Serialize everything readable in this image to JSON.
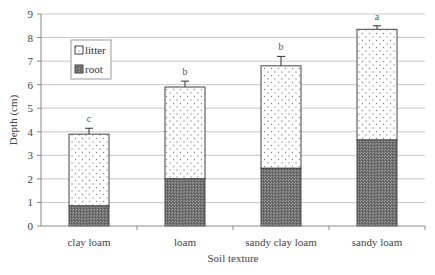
{
  "chart_data": {
    "type": "bar",
    "stacked": true,
    "title": "",
    "xlabel": "Soil texture",
    "ylabel": "Depth (cm)",
    "ylim": [
      0,
      9
    ],
    "yticks": [
      0,
      1,
      2,
      3,
      4,
      5,
      6,
      7,
      8,
      9
    ],
    "grid": true,
    "legend_position": "upper-left",
    "categories": [
      "clay loam",
      "loam",
      "sandy clay loam",
      "sandy loam"
    ],
    "series": [
      {
        "name": "root",
        "pattern": "dark-stipple",
        "values": [
          0.85,
          2.0,
          2.45,
          3.65
        ]
      },
      {
        "name": "litter",
        "pattern": "light-dotted",
        "values": [
          3.05,
          3.9,
          4.35,
          4.7
        ]
      }
    ],
    "totals": [
      3.9,
      5.9,
      6.8,
      8.35
    ],
    "error_bar_tops": [
      4.15,
      6.15,
      7.2,
      8.5
    ],
    "significance_letters": [
      "c",
      "b",
      "b",
      "a"
    ],
    "legend": [
      "litter",
      "root"
    ]
  },
  "colors": {
    "root": "#7a7a7a",
    "litter": "#ffffff",
    "grid": "#c8c8c8",
    "axis": "#888888"
  }
}
